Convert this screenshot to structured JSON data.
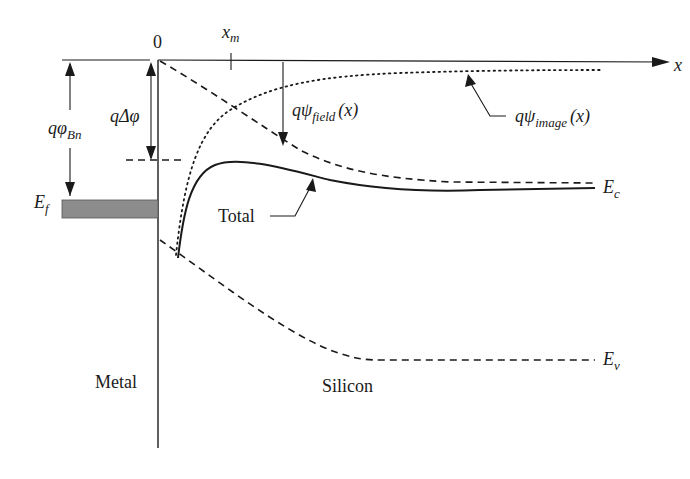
{
  "diagram": {
    "origin_label": "0",
    "x_axis_label": "x",
    "xm_label": "x",
    "xm_sub": "m",
    "barrier_label": {
      "main": "qφ",
      "sub": "Bn"
    },
    "lowering_label": {
      "main": "qΔφ"
    },
    "fermi_label": {
      "main": "E",
      "sub": "f"
    },
    "field_label": {
      "main": "qψ",
      "sub": "field",
      "arg": "(x)"
    },
    "image_label": {
      "main": "qψ",
      "sub": "image",
      "arg": "(x)"
    },
    "ec_label": {
      "main": "E",
      "sub": "c"
    },
    "ev_label": {
      "main": "E",
      "sub": "v"
    },
    "total_label": "Total",
    "metal_label": "Metal",
    "silicon_label": "Silicon",
    "colors": {
      "line": "#1a1a1a",
      "metal_fill": "#8c8c8c",
      "background": "#ffffff"
    }
  }
}
